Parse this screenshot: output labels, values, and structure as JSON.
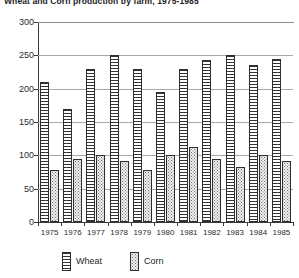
{
  "chart_data": {
    "type": "bar",
    "title": "Wheat and Corn production by farm, 1975-1985",
    "xlabel": "",
    "ylabel": "",
    "ylim": [
      0,
      300
    ],
    "yticks": [
      0,
      50,
      100,
      150,
      200,
      250,
      300
    ],
    "grid": true,
    "legend_position": "bottom",
    "categories": [
      "1975",
      "1976",
      "1977",
      "1978",
      "1979",
      "1980",
      "1981",
      "1982",
      "1983",
      "1984",
      "1985"
    ],
    "series": [
      {
        "name": "Wheat",
        "pattern": "horizontal-hatch",
        "color": "#333333",
        "values": [
          210,
          170,
          230,
          250,
          230,
          195,
          230,
          243,
          250,
          235,
          245
        ]
      },
      {
        "name": "Corn",
        "pattern": "dotted-stipple",
        "color": "#6e6e6e",
        "values": [
          78,
          95,
          100,
          92,
          78,
          100,
          112,
          95,
          82,
          100,
          92
        ]
      }
    ]
  },
  "legend": {
    "entries": [
      {
        "label": "Wheat"
      },
      {
        "label": "Corn"
      }
    ]
  }
}
